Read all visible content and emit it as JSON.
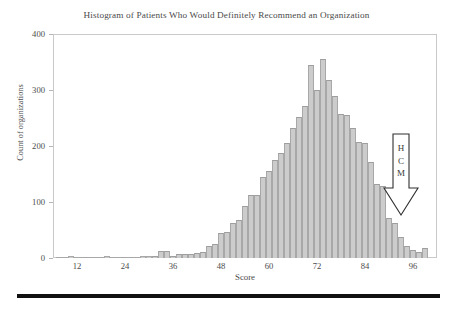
{
  "chart_data": {
    "type": "bar",
    "title": "Histogram of Patients Who Would Definitely Recommend an Organization",
    "xlabel": "Score",
    "ylabel": "Count of organizations",
    "xlim": [
      6,
      102
    ],
    "ylim": [
      0,
      400
    ],
    "xticks": [
      12,
      24,
      36,
      48,
      60,
      72,
      84,
      96
    ],
    "yticks": [
      0,
      100,
      200,
      300,
      400
    ],
    "grid": false,
    "legend": null,
    "bin_width": 1.5,
    "bar_color": "#cccccc",
    "bar_edge_color": "#a8a8a8",
    "annotations": [
      {
        "name": "hcm-arrow",
        "text": "HCM",
        "lines": [
          "H",
          "C",
          "M"
        ],
        "shape": "down-arrow",
        "points_to_score": 88.5
      }
    ],
    "bins": [
      {
        "score": 7.5,
        "count": 2
      },
      {
        "score": 9.0,
        "count": 1
      },
      {
        "score": 10.5,
        "count": 3
      },
      {
        "score": 12.0,
        "count": 2
      },
      {
        "score": 13.5,
        "count": 1
      },
      {
        "score": 15.0,
        "count": 1
      },
      {
        "score": 16.5,
        "count": 0
      },
      {
        "score": 18.0,
        "count": 2
      },
      {
        "score": 19.5,
        "count": 3
      },
      {
        "score": 21.0,
        "count": 2
      },
      {
        "score": 22.5,
        "count": 1
      },
      {
        "score": 24.0,
        "count": 1
      },
      {
        "score": 25.5,
        "count": 1
      },
      {
        "score": 27.0,
        "count": 2
      },
      {
        "score": 28.5,
        "count": 3
      },
      {
        "score": 30.0,
        "count": 3
      },
      {
        "score": 31.5,
        "count": 4
      },
      {
        "score": 33.0,
        "count": 12
      },
      {
        "score": 34.5,
        "count": 12
      },
      {
        "score": 36.0,
        "count": 4
      },
      {
        "score": 37.5,
        "count": 7
      },
      {
        "score": 39.0,
        "count": 8
      },
      {
        "score": 40.5,
        "count": 8
      },
      {
        "score": 42.0,
        "count": 9
      },
      {
        "score": 43.5,
        "count": 10
      },
      {
        "score": 45.0,
        "count": 22
      },
      {
        "score": 46.5,
        "count": 25
      },
      {
        "score": 48.0,
        "count": 45
      },
      {
        "score": 49.5,
        "count": 47
      },
      {
        "score": 51.0,
        "count": 62
      },
      {
        "score": 52.5,
        "count": 68
      },
      {
        "score": 54.0,
        "count": 92
      },
      {
        "score": 55.5,
        "count": 112
      },
      {
        "score": 57.0,
        "count": 113
      },
      {
        "score": 58.5,
        "count": 145
      },
      {
        "score": 60.0,
        "count": 155
      },
      {
        "score": 61.5,
        "count": 175
      },
      {
        "score": 63.0,
        "count": 188
      },
      {
        "score": 64.5,
        "count": 206
      },
      {
        "score": 66.0,
        "count": 232
      },
      {
        "score": 67.5,
        "count": 252
      },
      {
        "score": 69.0,
        "count": 272
      },
      {
        "score": 70.5,
        "count": 345
      },
      {
        "score": 72.0,
        "count": 300
      },
      {
        "score": 73.5,
        "count": 355
      },
      {
        "score": 75.0,
        "count": 318
      },
      {
        "score": 76.5,
        "count": 290
      },
      {
        "score": 78.0,
        "count": 258
      },
      {
        "score": 79.5,
        "count": 255
      },
      {
        "score": 81.0,
        "count": 232
      },
      {
        "score": 82.5,
        "count": 208
      },
      {
        "score": 84.0,
        "count": 205
      },
      {
        "score": 85.5,
        "count": 172
      },
      {
        "score": 87.0,
        "count": 132
      },
      {
        "score": 88.5,
        "count": 128
      },
      {
        "score": 90.0,
        "count": 72
      },
      {
        "score": 91.5,
        "count": 62
      },
      {
        "score": 93.0,
        "count": 38
      },
      {
        "score": 94.5,
        "count": 22
      },
      {
        "score": 96.0,
        "count": 14
      },
      {
        "score": 97.5,
        "count": 10
      },
      {
        "score": 99.0,
        "count": 18
      }
    ]
  }
}
